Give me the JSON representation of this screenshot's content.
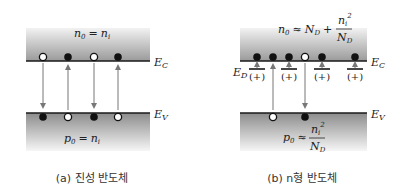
{
  "panels": [
    {
      "id": "intrinsic",
      "caption": "(a) 진성 반도체",
      "conduction_band": {
        "label_main": "E",
        "label_sub": "C",
        "equation": {
          "lhs": "n",
          "lhs_sub": "0",
          "op": "=",
          "rhs": "n",
          "rhs_sub": "i"
        }
      },
      "valence_band": {
        "label_main": "E",
        "label_sub": "V",
        "equation": {
          "lhs": "p",
          "lhs_sub": "0",
          "op": "=",
          "rhs": "n",
          "rhs_sub": "i"
        }
      },
      "cb_particles": [
        "hole",
        "electron",
        "hole",
        "electron"
      ],
      "vb_particles": [
        "electron",
        "hole",
        "electron",
        "hole"
      ],
      "transitions": [
        "down",
        "up",
        "down",
        "up"
      ]
    },
    {
      "id": "n-type",
      "caption": "(b) n형 반도체",
      "conduction_band": {
        "label_main": "E",
        "label_sub": "C",
        "equation": {
          "lhs": "n",
          "lhs_sub": "0",
          "op": "≈",
          "term1": "N",
          "term1_sub": "D",
          "plus": "+",
          "frac_num": "n",
          "frac_num_sub": "i",
          "frac_num_sup": "2",
          "frac_den": "N",
          "frac_den_sub": "D"
        }
      },
      "valence_band": {
        "label_main": "E",
        "label_sub": "V",
        "equation": {
          "lhs": "p",
          "lhs_sub": "0",
          "op": "≈",
          "frac_num": "n",
          "frac_num_sub": "i",
          "frac_num_sup": "2",
          "frac_den": "N",
          "frac_den_sub": "D"
        }
      },
      "donor_level": {
        "label_main": "E",
        "label_sub": "D",
        "ion_label": "(+)",
        "count": 4
      },
      "cb_particles": [
        "electron",
        "electron",
        "electron",
        "hole",
        "electron",
        "electron"
      ],
      "vb_particles": [
        "hole",
        "electron"
      ],
      "transitions": [
        "up",
        "down"
      ]
    }
  ],
  "colors": {
    "band_dark": "#8f8f8f",
    "band_light": "#f4f4f4",
    "line": "#1a1a1a",
    "arrow": "#777777",
    "electron": "#111111",
    "hole_fill": "#ffffff"
  }
}
